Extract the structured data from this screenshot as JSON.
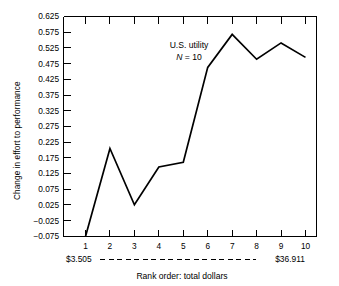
{
  "chart_data": {
    "type": "line",
    "title": "",
    "annotation": {
      "line1": "U.S. utility",
      "line2_symbol": "N",
      "line2_rest": " = 10"
    },
    "xlabel": "Rank order:  total dollars",
    "ylabel": "Change in effort to performance",
    "categories": [
      "1",
      "2",
      "3",
      "4",
      "5",
      "6",
      "7",
      "8",
      "9",
      "10"
    ],
    "x": [
      1,
      2,
      3,
      4,
      5,
      6,
      7,
      8,
      9,
      10
    ],
    "values": [
      -0.075,
      0.205,
      0.026,
      0.146,
      0.161,
      0.463,
      0.568,
      0.489,
      0.541,
      0.495
    ],
    "ylim": [
      -0.075,
      0.625
    ],
    "xlim": [
      0.35,
      10.4
    ],
    "ytick_labels": [
      "0.625",
      "0.575",
      "0.525",
      "0.475",
      "0.425",
      "0.375",
      "0.325",
      "0.275",
      "0.225",
      "0.175",
      "0.125",
      "0.075",
      "0.025",
      "−0.025",
      "−0.075"
    ],
    "ytick_values": [
      0.625,
      0.575,
      0.525,
      0.475,
      0.425,
      0.375,
      0.325,
      0.275,
      0.225,
      0.175,
      0.125,
      0.075,
      0.025,
      -0.025,
      -0.075
    ],
    "xtick_labels": [
      "1",
      "2",
      "3",
      "4",
      "5",
      "6",
      "7",
      "8",
      "9",
      "10"
    ],
    "range_left_label": "$3.505",
    "range_right_label": "$36.911",
    "grid": false,
    "legend": "none",
    "line_color": "#000000",
    "background_color": "#ffffff"
  }
}
